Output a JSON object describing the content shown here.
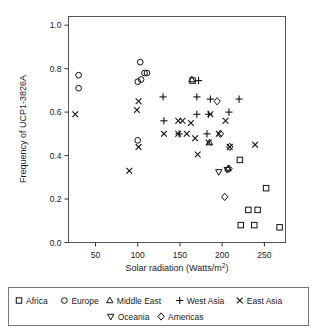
{
  "chart_data": {
    "type": "scatter",
    "title": "",
    "xlabel": "Solar radiation (Watts/m²)",
    "ylabel": "Frequency of UCP1-3826A",
    "xlim": [
      18,
      275
    ],
    "ylim": [
      0.0,
      1.04
    ],
    "xticks": [
      50,
      100,
      150,
      200,
      250
    ],
    "yticks": [
      0.0,
      0.2,
      0.4,
      0.6,
      0.8,
      1.0
    ],
    "xtick_labels": [
      "50",
      "100",
      "150",
      "200",
      "250"
    ],
    "ytick_labels": [
      "0.0",
      "0.2",
      "0.4",
      "0.6",
      "0.8",
      "1.0"
    ],
    "grid": false,
    "legend_position": "below",
    "series": [
      {
        "name": "Africa",
        "marker": "square",
        "points": [
          [
            165,
            0.745
          ],
          [
            221,
            0.38
          ],
          [
            252,
            0.25
          ],
          [
            231,
            0.15
          ],
          [
            242,
            0.15
          ],
          [
            222,
            0.08
          ],
          [
            238,
            0.08
          ],
          [
            268,
            0.07
          ]
        ]
      },
      {
        "name": "Europe",
        "marker": "circle",
        "points": [
          [
            30,
            0.77
          ],
          [
            30,
            0.71
          ],
          [
            103,
            0.83
          ],
          [
            100,
            0.74
          ],
          [
            104,
            0.75
          ],
          [
            108,
            0.78
          ],
          [
            111,
            0.78
          ],
          [
            100,
            0.47
          ]
        ]
      },
      {
        "name": "Middle East",
        "marker": "triangle",
        "points": [
          [
            164,
            0.75
          ],
          [
            185,
            0.46
          ],
          [
            207,
            0.34
          ]
        ]
      },
      {
        "name": "West Asia",
        "marker": "plus",
        "points": [
          [
            130,
            0.67
          ],
          [
            131,
            0.56
          ],
          [
            170,
            0.67
          ],
          [
            170,
            0.59
          ],
          [
            184,
            0.59
          ],
          [
            186,
            0.66
          ],
          [
            220,
            0.66
          ],
          [
            208,
            0.6
          ],
          [
            172,
            0.745
          ],
          [
            149,
            0.5
          ],
          [
            182,
            0.5
          ]
        ]
      },
      {
        "name": "East Asia",
        "marker": "cross",
        "points": [
          [
            26,
            0.59
          ],
          [
            90,
            0.33
          ],
          [
            101,
            0.65
          ],
          [
            99,
            0.61
          ],
          [
            101,
            0.44
          ],
          [
            131,
            0.5
          ],
          [
            148,
            0.56
          ],
          [
            153,
            0.56
          ],
          [
            148,
            0.5
          ],
          [
            163,
            0.55
          ],
          [
            168,
            0.48
          ],
          [
            158,
            0.5
          ],
          [
            171,
            0.405
          ],
          [
            184,
            0.46
          ],
          [
            186,
            0.59
          ],
          [
            196,
            0.5
          ],
          [
            204,
            0.56
          ],
          [
            209,
            0.44
          ],
          [
            239,
            0.45
          ]
        ]
      },
      {
        "name": "Oceania",
        "marker": "triangle-down",
        "points": [
          [
            196,
            0.325
          ],
          [
            206,
            0.335
          ]
        ]
      },
      {
        "name": "Americas",
        "marker": "diamond",
        "points": [
          [
            194,
            0.65
          ],
          [
            198,
            0.5
          ],
          [
            209,
            0.44
          ],
          [
            208,
            0.34
          ],
          [
            203,
            0.21
          ]
        ]
      }
    ]
  },
  "legend": {
    "row1": [
      {
        "label": "Africa",
        "marker": "square"
      },
      {
        "label": "Europe",
        "marker": "circle"
      },
      {
        "label": "Middle East",
        "marker": "triangle"
      },
      {
        "label": "West Asia",
        "marker": "plus"
      },
      {
        "label": "East Asia",
        "marker": "cross"
      }
    ],
    "row2": [
      {
        "label": "Oceania",
        "marker": "triangle-down"
      },
      {
        "label": "Americas",
        "marker": "diamond"
      }
    ]
  }
}
